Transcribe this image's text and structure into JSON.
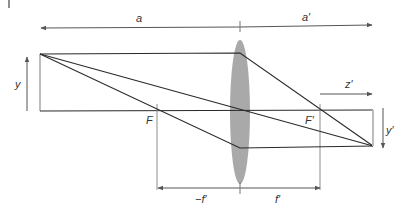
{
  "diagram": {
    "labels": {
      "a": "a",
      "a_prime": "a′",
      "y": "y",
      "y_prime": "y′",
      "F": "F",
      "F_prime": "F′",
      "z_prime": "z′",
      "minus_f_prime": "−f′",
      "f_prime": "f′"
    },
    "colors": {
      "ray": "#2a2a2a",
      "lens": "#a9a9a9",
      "guide": "#8c8c8c",
      "object_bar": "#bdbdbd",
      "label": "#333333"
    },
    "geometry": {
      "axis_y": 111,
      "lens_x": 240,
      "object_x": 40,
      "object_top_y": 54,
      "image_x": 373,
      "image_bottom_y": 146,
      "F_x": 157,
      "F_prime_x": 320
    }
  }
}
